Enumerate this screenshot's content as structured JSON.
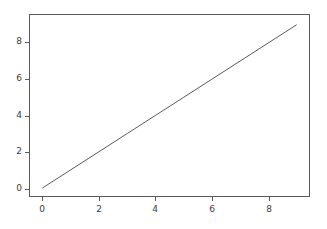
{
  "chart_data": {
    "type": "line",
    "title": "",
    "subtitle": "",
    "xlabel": "",
    "ylabel": "",
    "grid": false,
    "legend": false,
    "legend_position": "none",
    "xlim": [
      -0.45,
      9.45
    ],
    "ylim": [
      -0.45,
      9.55
    ],
    "xticks": [
      0,
      2,
      4,
      6,
      8
    ],
    "yticks": [
      0,
      2,
      4,
      6,
      8
    ],
    "xtick_labels": [
      "0",
      "2",
      "4",
      "6",
      "8"
    ],
    "ytick_labels": [
      "0",
      "2",
      "4",
      "6",
      "8"
    ],
    "series": [
      {
        "name": "y = x",
        "color": "#5a5a5a",
        "line_width": 1,
        "marker": "none",
        "x": [
          0,
          1,
          2,
          3,
          4,
          5,
          6,
          7,
          8,
          9
        ],
        "values": [
          0,
          1,
          2,
          3,
          4,
          5,
          6,
          7,
          8,
          9
        ]
      }
    ]
  },
  "figure": {
    "background_color": "#ffffff",
    "axes_edge_color": "#5a5a5a",
    "tick_label_color": "#3c3c3c"
  }
}
